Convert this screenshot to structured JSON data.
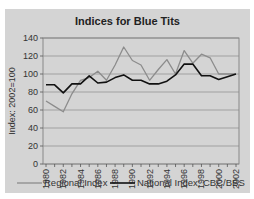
{
  "chart_data": {
    "type": "line",
    "title": "Indices for Blue Tits",
    "xlabel": "",
    "ylabel": "Index: 2002=100",
    "ylim": [
      0,
      140
    ],
    "yticks": [
      0,
      20,
      40,
      60,
      80,
      100,
      120,
      140
    ],
    "xtick_labels": [
      "1980",
      "1982",
      "1984",
      "1986",
      "1988",
      "1990",
      "1992",
      "1994",
      "1996",
      "1998",
      "2000",
      "2002"
    ],
    "grid": true,
    "legend_position": "bottom",
    "x": [
      1980,
      1981,
      1982,
      1983,
      1984,
      1985,
      1986,
      1987,
      1988,
      1989,
      1990,
      1991,
      1992,
      1993,
      1994,
      1995,
      1996,
      1997,
      1998,
      1999,
      2000,
      2001,
      2002
    ],
    "series": [
      {
        "name": "Regional Index",
        "color": "#8c8c8c",
        "values": [
          70,
          64,
          58,
          78,
          93,
          96,
          103,
          93,
          110,
          130,
          115,
          110,
          93,
          105,
          116,
          100,
          126,
          112,
          122,
          118,
          100,
          100,
          100
        ]
      },
      {
        "name": "National Index: CBC/BBS",
        "color": "#111111",
        "values": [
          88,
          88,
          79,
          89,
          89,
          98,
          90,
          91,
          96,
          99,
          93,
          93,
          89,
          89,
          92,
          99,
          111,
          111,
          98,
          98,
          94,
          97,
          100
        ]
      }
    ]
  }
}
